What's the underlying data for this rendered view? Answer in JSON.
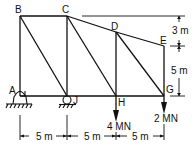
{
  "diagram": {
    "type": "truss",
    "nodes": {
      "A": {
        "label": "A"
      },
      "B": {
        "label": "B"
      },
      "C": {
        "label": "C"
      },
      "D": {
        "label": "D"
      },
      "E": {
        "label": "E"
      },
      "G": {
        "label": "G"
      },
      "H": {
        "label": "H"
      },
      "J": {
        "label": "J"
      }
    },
    "supports": {
      "A": "pin",
      "J": "roller"
    },
    "loads": [
      {
        "node": "H",
        "label": "4 MN",
        "direction": "down"
      },
      {
        "node": "G",
        "label": "2 MN",
        "direction": "down"
      }
    ],
    "dimensions": {
      "horizontal": [
        "5 m",
        "5 m",
        "5 m"
      ],
      "vertical": [
        "3 m",
        "5 m"
      ]
    }
  }
}
